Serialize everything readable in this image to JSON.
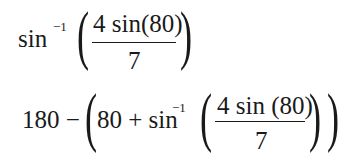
{
  "equations": [
    {
      "func": "sin",
      "exponent": "−1",
      "open_paren": "(",
      "numerator": "4 sin(80)",
      "denominator": "7",
      "close_paren": ")"
    },
    {
      "prefix": "180 −",
      "open_paren_outer": "(",
      "term": "80 + sin",
      "exponent": "−1",
      "open_paren_inner": "(",
      "numerator": "4 sin (80)",
      "denominator": "7",
      "close_paren_inner": ")",
      "close_paren_outer": ")"
    }
  ]
}
